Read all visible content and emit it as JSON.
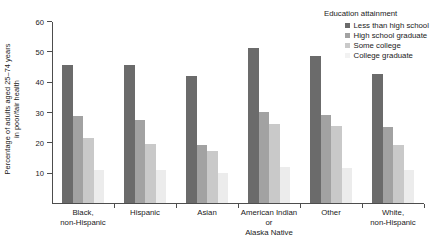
{
  "chart_data": {
    "type": "bar",
    "title": "",
    "xlabel": "",
    "ylabel": "Percentage of adults aged 25–74 years in poor/fair health",
    "ylabel_line1": "Percentage of adults aged 25–74 years",
    "ylabel_line2": "in poor/fair health",
    "ylim": [
      0,
      60
    ],
    "yticks": [
      0,
      10,
      20,
      30,
      40,
      50,
      60
    ],
    "ytick_labels": [
      "",
      "10",
      "20",
      "30",
      "40",
      "50",
      "60"
    ],
    "grid": false,
    "legend_position": "top-right",
    "legend_title": "Education attainment",
    "categories": [
      [
        "Black,",
        "non-Hispanic"
      ],
      [
        "Hispanic"
      ],
      [
        "Asian"
      ],
      [
        "American Indian",
        "or",
        "Alaska Native"
      ],
      [
        "Other"
      ],
      [
        "White,",
        "non-Hispanic"
      ]
    ],
    "category_labels": [
      "Black, non-Hispanic",
      "Hispanic",
      "Asian",
      "American Indian or Alaska Native",
      "Other",
      "White, non-Hispanic"
    ],
    "series": [
      {
        "name": "Less than high school",
        "color": "#6b6b6b",
        "values": [
          45.5,
          45.5,
          42.0,
          51.0,
          48.5,
          42.5
        ]
      },
      {
        "name": "High school graduate",
        "color": "#a2a2a2",
        "values": [
          28.8,
          27.5,
          19.0,
          30.0,
          29.0,
          25.0
        ]
      },
      {
        "name": "Some college",
        "color": "#c9c9c9",
        "values": [
          21.5,
          19.5,
          17.0,
          26.0,
          25.5,
          19.0
        ]
      },
      {
        "name": "College graduate",
        "color": "#ececec",
        "values": [
          11.0,
          11.0,
          10.0,
          12.0,
          11.5,
          11.0
        ]
      }
    ]
  }
}
